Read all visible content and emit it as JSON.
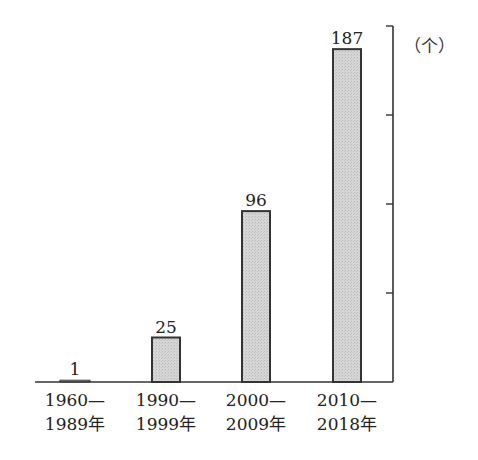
{
  "chart_data": {
    "type": "bar",
    "title": "",
    "xlabel": "",
    "ylabel": "",
    "unit_label": "（个）",
    "categories": [
      "1960—1989年",
      "1990—1999年",
      "2000—2009年",
      "2010—2018年"
    ],
    "category_lines": [
      [
        "1960—",
        "1989年"
      ],
      [
        "1990—",
        "1999年"
      ],
      [
        "2000—",
        "2009年"
      ],
      [
        "2010—",
        "2018年"
      ]
    ],
    "values": [
      1,
      25,
      96,
      187
    ],
    "data_labels": [
      "1",
      "25",
      "96",
      "187"
    ],
    "ylim": [
      0,
      200
    ],
    "y_ticks": [
      50,
      100,
      150,
      200
    ],
    "y_tick_labels_shown": false,
    "y_axis_position": "right",
    "grid": false,
    "legend": null,
    "bar_fill": "#d4d4d4",
    "bar_stroke": "#333333"
  }
}
